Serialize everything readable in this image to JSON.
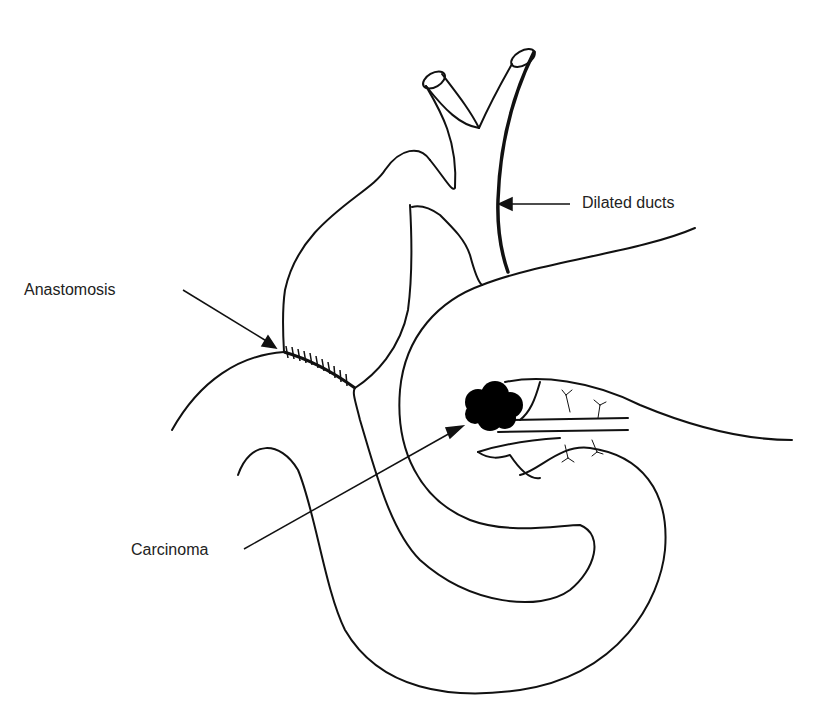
{
  "figure": {
    "type": "anatomical line diagram",
    "labels": {
      "dilated_ducts": "Dilated ducts",
      "anastomosis": "Anastomosis",
      "carcinoma": "Carcinoma"
    },
    "colors": {
      "line": "#111111",
      "tumor": "#000000",
      "background": "#ffffff"
    }
  }
}
